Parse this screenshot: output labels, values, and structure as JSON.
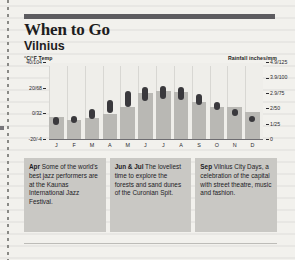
{
  "header": {
    "title": "When to Go",
    "subtitle": "Vilnius",
    "top_rule_color": "#5d5c60"
  },
  "axes": {
    "left_caption_unit": "°C/°F",
    "left_caption_label": "Temp",
    "right_caption_label": "Rainfall",
    "right_caption_unit": "inches/mm",
    "left_ticks": [
      "40/104",
      "20/68",
      "0/32",
      "-20/-4"
    ],
    "right_ticks": [
      "4.9/125",
      "3.9/100",
      "2.9/75",
      "2/50",
      "1/25",
      "0"
    ]
  },
  "chart_data": {
    "type": "bar",
    "subtitle": "Vilnius",
    "xlabel": "",
    "ylabel": "Temp °C/°F",
    "y2label": "Rainfall inches/mm",
    "grid": false,
    "legend": "none",
    "categories": [
      "J",
      "F",
      "M",
      "A",
      "M",
      "J",
      "J",
      "A",
      "S",
      "O",
      "N",
      "D"
    ],
    "temp_axis": {
      "unit": "°C/°F",
      "ticks": [
        "40/104",
        "20/68",
        "0/32",
        "-20/-4"
      ],
      "tick_values_c": [
        40,
        20,
        0,
        -20
      ],
      "ylim": [
        -20,
        40
      ]
    },
    "rain_axis": {
      "unit": "inches/mm",
      "ticks": [
        "4.9/125",
        "3.9/100",
        "2.9/75",
        "2/50",
        "1/25",
        "0"
      ],
      "tick_values_mm": [
        125,
        100,
        75,
        50,
        25,
        0
      ],
      "ylim": [
        0,
        125
      ]
    },
    "series": [
      {
        "name": "Temperature range (°C)",
        "type": "range-bar",
        "color": "#3a393d",
        "low": [
          -8,
          -7,
          -4,
          1,
          6,
          10,
          12,
          11,
          7,
          3,
          -1,
          -6
        ],
        "high": [
          -2,
          -1,
          4,
          11,
          18,
          21,
          22,
          21,
          16,
          10,
          4,
          -1
        ]
      },
      {
        "name": "Rainfall (mm)",
        "type": "bar",
        "color": "#b9b8b4",
        "values": [
          38,
          33,
          35,
          43,
          53,
          77,
          80,
          78,
          62,
          54,
          54,
          45
        ]
      }
    ]
  },
  "tips": [
    {
      "month": "Apr",
      "text": " Some of the world's best jazz performers are at the Kaunas International Jazz Festival."
    },
    {
      "month": "Jun & Jul",
      "text": " The loveliest time to explore the forests and sand dunes of the Curonian Spit."
    },
    {
      "month": "Sep",
      "text": " Vilnius City Days, a celebration of the capital with street theatre, music and fashion."
    }
  ],
  "colors": {
    "paper": "#f2f1ed",
    "temp_bar": "#3a393d",
    "rain_bar": "#b9b8b4",
    "tip_box": "#c9c8c4"
  }
}
